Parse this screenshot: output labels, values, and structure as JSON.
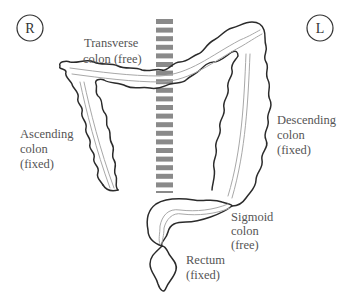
{
  "markers": {
    "right": "R",
    "left": "L"
  },
  "labels": {
    "transverse": [
      "Transverse",
      "colon (free)"
    ],
    "ascending": [
      "Ascending",
      "colon",
      "(fixed)"
    ],
    "descending": [
      "Descending",
      "colon",
      "(fixed)"
    ],
    "sigmoid": [
      "Sigmoid",
      "colon",
      "(free)"
    ],
    "rectum": [
      "Rectum",
      "(fixed)"
    ]
  },
  "spine": {
    "segment_count": 21
  }
}
